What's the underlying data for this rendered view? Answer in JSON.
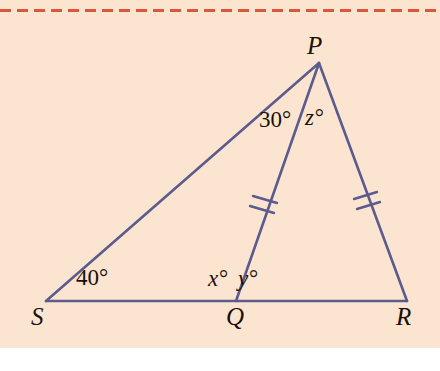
{
  "figure": {
    "kind": "geometry-diagram",
    "background_color": "#fbe5d0",
    "page_color": "#ffffff",
    "stroke_color": "#5c5b8e",
    "label_color": "#1a1008",
    "rule_color": "#d9583c"
  },
  "vertices": {
    "P": {
      "label": "P",
      "x": 319,
      "y": 63
    },
    "S": {
      "label": "S",
      "x": 46,
      "y": 301
    },
    "Q": {
      "label": "Q",
      "x": 236,
      "y": 301
    },
    "R": {
      "label": "R",
      "x": 407,
      "y": 301
    }
  },
  "segments": [
    {
      "name": "SP",
      "from": "S",
      "to": "P",
      "ticks": 0
    },
    {
      "name": "SR",
      "from": "S",
      "to": "R",
      "ticks": 0
    },
    {
      "name": "PQ",
      "from": "P",
      "to": "Q",
      "ticks": 2
    },
    {
      "name": "PR",
      "from": "P",
      "to": "R",
      "ticks": 2
    }
  ],
  "angles": {
    "at_S": "40°",
    "at_P_SPQ": "30°",
    "at_P_QPR": "z°",
    "at_Q_left": "x°",
    "at_Q_right": "y°"
  }
}
